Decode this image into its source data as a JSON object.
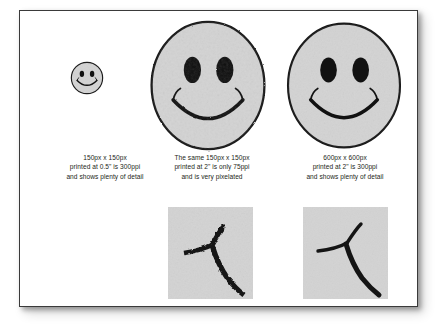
{
  "figure": {
    "title_alt": "Image resolution comparison: ppi and pixelation",
    "background_color": "#ffffff",
    "frame_border_color": "#3a3a3a",
    "face_fill_color": "#d3d3d3",
    "ink_color": "#111111",
    "text_color": "#231f20"
  },
  "panels": [
    {
      "id": "left",
      "smiley_name": "smiley-face-small",
      "smiley_size_label": "small",
      "caption": {
        "line1": "150px x 150px",
        "line2": "printed at 0.5\" is 300ppi",
        "line3": "and shows plenty of detail"
      }
    },
    {
      "id": "middle",
      "smiley_name": "smiley-face-pixelated",
      "smiley_size_label": "large-pixelated",
      "caption": {
        "line1": "The same 150px x 150px",
        "line2": "printed at 2\" is only 75ppi",
        "line3": "and is very pixelated"
      },
      "detail": {
        "name": "detail-crop-pixelated",
        "label_alt": "Pixelated close-up of mouth corner"
      }
    },
    {
      "id": "right",
      "smiley_name": "smiley-face-smooth",
      "smiley_size_label": "large-smooth",
      "caption": {
        "line1": "600px x 600px",
        "line2": "printed at 2\" is 300ppi",
        "line3": "and shows plenty of detail"
      },
      "detail": {
        "name": "detail-crop-smooth",
        "label_alt": "Smooth close-up of mouth corner"
      }
    }
  ]
}
